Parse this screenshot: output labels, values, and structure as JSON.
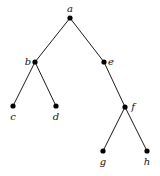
{
  "diagram": {
    "type": "tree",
    "nodes": [
      {
        "id": "a",
        "label": "a",
        "x": 70,
        "y": 18,
        "lx": 70,
        "ly": 12,
        "anchor": "middle"
      },
      {
        "id": "b",
        "label": "b",
        "x": 35,
        "y": 62,
        "lx": 28,
        "ly": 65,
        "anchor": "middle"
      },
      {
        "id": "e",
        "label": "e",
        "x": 104,
        "y": 62,
        "lx": 111,
        "ly": 65,
        "anchor": "middle"
      },
      {
        "id": "c",
        "label": "c",
        "x": 13,
        "y": 106,
        "lx": 13,
        "ly": 120,
        "anchor": "middle"
      },
      {
        "id": "d",
        "label": "d",
        "x": 56,
        "y": 106,
        "lx": 56,
        "ly": 120,
        "anchor": "middle"
      },
      {
        "id": "f",
        "label": "f",
        "x": 125,
        "y": 107,
        "lx": 133,
        "ly": 110,
        "anchor": "middle"
      },
      {
        "id": "g",
        "label": "g",
        "x": 103,
        "y": 151,
        "lx": 103,
        "ly": 165,
        "anchor": "middle"
      },
      {
        "id": "h",
        "label": "h",
        "x": 147,
        "y": 151,
        "lx": 147,
        "ly": 165,
        "anchor": "middle"
      }
    ],
    "edges": [
      [
        "a",
        "b"
      ],
      [
        "a",
        "e"
      ],
      [
        "b",
        "c"
      ],
      [
        "b",
        "d"
      ],
      [
        "e",
        "f"
      ],
      [
        "f",
        "g"
      ],
      [
        "f",
        "h"
      ]
    ]
  }
}
